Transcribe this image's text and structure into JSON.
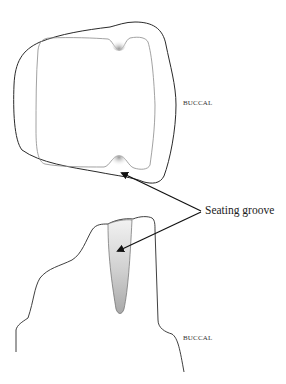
{
  "figure": {
    "type": "dental-diagram",
    "views": [
      {
        "name": "occlusal-view",
        "side_label": "BUCCAL"
      },
      {
        "name": "proximal-view",
        "side_label": "BUCCAL"
      }
    ],
    "callout": {
      "label": "Seating groove",
      "arrow_count": 2
    },
    "colors": {
      "outline_outer": "#2a2a2a",
      "outline_inner": "#777777",
      "groove_shade": "#a8a8a8",
      "arrow": "#111111",
      "background": "#ffffff"
    }
  }
}
